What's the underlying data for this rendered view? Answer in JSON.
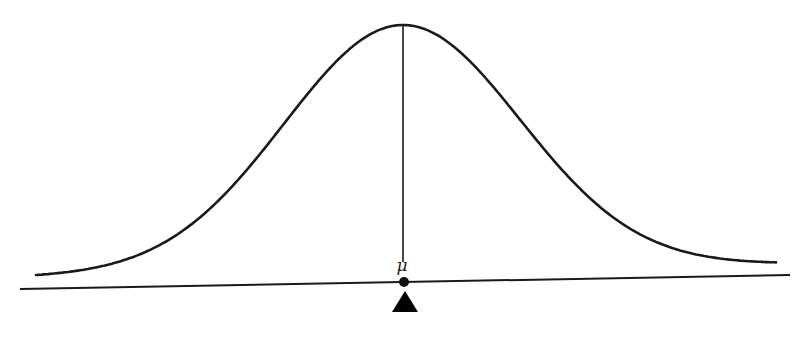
{
  "diagram": {
    "curve": {
      "type": "gaussian",
      "peak_x": 402,
      "peak_y": 25,
      "baseline_left_y": 277,
      "baseline_right_y": 264,
      "x_start": 36,
      "x_end": 776,
      "sigma_px": 118,
      "stroke": "#1a1a1a"
    },
    "axis": {
      "x1": 20,
      "y1": 289,
      "x2": 790,
      "y2": 275,
      "stroke": "#1a1a1a"
    },
    "mean_line": {
      "x": 403,
      "y_top": 25,
      "y_bottom": 282
    },
    "mean_label": "μ",
    "mean_point": {
      "x": 404,
      "y": 282,
      "r": 5
    },
    "fulcrum": {
      "apex_x": 405,
      "apex_y": 291,
      "half_width": 13,
      "base_y": 312,
      "fill": "#000000"
    }
  }
}
